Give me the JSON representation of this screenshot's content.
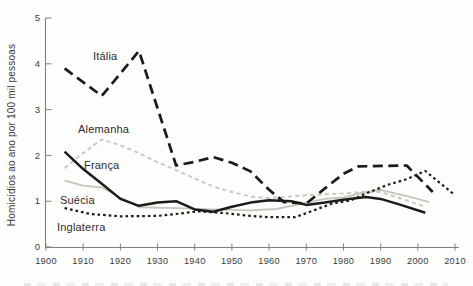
{
  "figure": {
    "y_axis_title": "Homicídios ao ano por 100 mil pessoas",
    "background": "#fdfdfb"
  },
  "chart_data": {
    "type": "line",
    "title": "",
    "xlabel": "",
    "ylabel": "Homicídios ao ano por 100 mil pessoas",
    "xlim": [
      1900,
      2010
    ],
    "ylim": [
      0,
      5
    ],
    "x_ticks": [
      1900,
      1910,
      1920,
      1930,
      1940,
      1950,
      1960,
      1970,
      1980,
      1990,
      2000,
      2010
    ],
    "y_ticks": [
      0,
      1,
      2,
      3,
      4,
      5
    ],
    "grid": false,
    "legend": "inline-labels",
    "axis_color": "#81817c",
    "tick_label_color": "#3c3c3a",
    "label_color": "#2e2e2c",
    "series": [
      {
        "name": "Itália",
        "color": "#1b1b19",
        "line_style": "long-dash",
        "dash": "10 5.5",
        "width": 2.7,
        "z": 1,
        "label_pos": [
          93,
          60
        ],
        "points": [
          [
            1905,
            3.9
          ],
          [
            1915,
            3.3
          ],
          [
            1925,
            4.28
          ],
          [
            1935,
            1.78
          ],
          [
            1940,
            1.86
          ],
          [
            1945,
            1.96
          ],
          [
            1950,
            1.84
          ],
          [
            1955,
            1.65
          ],
          [
            1960,
            1.25
          ],
          [
            1964,
            0.98
          ],
          [
            1970,
            0.95
          ],
          [
            1975,
            1.28
          ],
          [
            1980,
            1.6
          ],
          [
            1984,
            1.76
          ],
          [
            1997,
            1.78
          ],
          [
            2004,
            1.2
          ]
        ]
      },
      {
        "name": "Alemanha",
        "color": "#c9c9c2",
        "line_style": "short-dash",
        "dash": "4.2 3.2",
        "width": 1.9,
        "z": 0,
        "label_pos": [
          78,
          133
        ],
        "points": [
          [
            1905,
            1.72
          ],
          [
            1910,
            2.05
          ],
          [
            1915,
            2.35
          ],
          [
            1920,
            2.22
          ],
          [
            1925,
            2.05
          ],
          [
            1930,
            1.85
          ],
          [
            1935,
            1.68
          ],
          [
            1940,
            1.5
          ],
          [
            1945,
            1.32
          ],
          [
            1950,
            1.2
          ],
          [
            1955,
            1.1
          ],
          [
            1960,
            1.07
          ],
          [
            1965,
            1.1
          ],
          [
            1970,
            1.13
          ],
          [
            1975,
            1.15
          ],
          [
            1980,
            1.17
          ],
          [
            1985,
            1.2
          ],
          [
            1990,
            1.2
          ],
          [
            1995,
            1.07
          ],
          [
            2002,
            0.88
          ]
        ]
      },
      {
        "name": "França",
        "color": "#1b1b19",
        "line_style": "solid",
        "dash": null,
        "width": 2.5,
        "z": 1,
        "label_pos": [
          84,
          169
        ],
        "points": [
          [
            1905,
            2.08
          ],
          [
            1910,
            1.7
          ],
          [
            1915,
            1.38
          ],
          [
            1920,
            1.05
          ],
          [
            1925,
            0.9
          ],
          [
            1930,
            0.97
          ],
          [
            1935,
            1.0
          ],
          [
            1940,
            0.82
          ],
          [
            1945,
            0.77
          ],
          [
            1950,
            0.88
          ],
          [
            1955,
            0.97
          ],
          [
            1960,
            1.02
          ],
          [
            1966,
            1.0
          ],
          [
            1970,
            0.92
          ],
          [
            1975,
            0.97
          ],
          [
            1980,
            1.03
          ],
          [
            1986,
            1.09
          ],
          [
            1990,
            1.05
          ],
          [
            1995,
            0.93
          ],
          [
            2002,
            0.75
          ]
        ]
      },
      {
        "name": "Suécia",
        "color": "#c6c6bf",
        "line_style": "solid",
        "dash": null,
        "width": 1.9,
        "z": 0,
        "label_pos": [
          60,
          204
        ],
        "points": [
          [
            1905,
            1.45
          ],
          [
            1910,
            1.34
          ],
          [
            1915,
            1.3
          ],
          [
            1920,
            1.08
          ],
          [
            1925,
            0.87
          ],
          [
            1935,
            0.85
          ],
          [
            1945,
            0.82
          ],
          [
            1955,
            0.8
          ],
          [
            1962,
            0.83
          ],
          [
            1970,
            0.97
          ],
          [
            1975,
            1.05
          ],
          [
            1980,
            1.08
          ],
          [
            1985,
            1.18
          ],
          [
            1990,
            1.25
          ],
          [
            1995,
            1.15
          ],
          [
            2000,
            1.05
          ],
          [
            2003,
            0.98
          ]
        ]
      },
      {
        "name": "Inglaterra",
        "color": "#1b1b19",
        "line_style": "dotted",
        "dash": "2.6 3",
        "width": 2.2,
        "z": 1,
        "label_pos": [
          57,
          231
        ],
        "points": [
          [
            1905,
            0.85
          ],
          [
            1912,
            0.72
          ],
          [
            1920,
            0.67
          ],
          [
            1930,
            0.68
          ],
          [
            1935,
            0.72
          ],
          [
            1941,
            0.78
          ],
          [
            1948,
            0.74
          ],
          [
            1955,
            0.68
          ],
          [
            1960,
            0.65
          ],
          [
            1967,
            0.65
          ],
          [
            1972,
            0.8
          ],
          [
            1977,
            0.95
          ],
          [
            1982,
            1.02
          ],
          [
            1987,
            1.2
          ],
          [
            1992,
            1.36
          ],
          [
            1997,
            1.48
          ],
          [
            2002,
            1.66
          ],
          [
            2010,
            1.13
          ]
        ]
      }
    ]
  }
}
